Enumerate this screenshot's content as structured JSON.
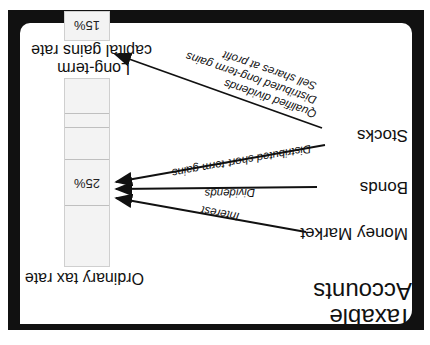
{
  "title": {
    "line1": "Taxable",
    "line2": "Accounts"
  },
  "accounts": [
    {
      "name": "Money Market"
    },
    {
      "name": "Bonds"
    },
    {
      "name": "Stocks"
    }
  ],
  "flows": [
    {
      "from": "Money Market",
      "label": "Interest",
      "to": "Ordinary tax rate"
    },
    {
      "from": "Bonds",
      "label": "Dividends",
      "to": "Ordinary tax rate"
    },
    {
      "from": "Stocks",
      "label": "Distributed short-term gains",
      "to": "Ordinary tax rate"
    },
    {
      "from": "Stocks",
      "label": "Qualified dividends",
      "to": "Long-term capital gains rate"
    },
    {
      "from": "Stocks",
      "label": "Distributed long-term gains",
      "to": "Long-term capital gains rate"
    },
    {
      "from": "Stocks",
      "label": "Sell shares at profit",
      "to": "Long-term capital gains rate"
    }
  ],
  "rates": {
    "ordinary": {
      "label": "Ordinary tax rate",
      "value": "25%"
    },
    "long_term": {
      "label_line1": "Long-term",
      "label_line2": "capital gains rate",
      "value": "15%"
    }
  },
  "colors": {
    "frame": "#111111",
    "bar_fill": "#f3f3f3",
    "bar_border": "#cfcfcf"
  }
}
